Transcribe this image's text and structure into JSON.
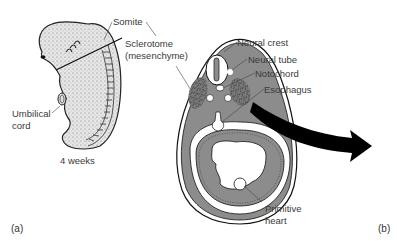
{
  "figure": {
    "panel_a": {
      "label": "(a)",
      "caption": "4 weeks",
      "labels": {
        "somite": "Somite",
        "sclerotome_line1": "Sclerotome",
        "sclerotome_line2": "(mesenchyme)",
        "umbilical_line1": "Umbilical",
        "umbilical_line2": "cord"
      }
    },
    "panel_b": {
      "label": "(b)",
      "labels": {
        "neural_crest": "Neural crest",
        "neural_tube": "Neural tube",
        "notochord": "Notochord",
        "esophagus": "Esophagus",
        "primitive_heart_line1": "Primitive",
        "primitive_heart_line2": "heart"
      }
    },
    "colors": {
      "tissue_gray": "#8c8c8c",
      "outline": "#1a1a1a",
      "embryo_fill": "#e4e4e4",
      "arrow": "#000000"
    }
  }
}
